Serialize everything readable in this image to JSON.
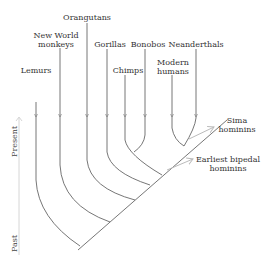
{
  "diagram": {
    "type": "phylogenetic-tree",
    "taxa": [
      {
        "label": "Lemurs"
      },
      {
        "label": "New World monkeys"
      },
      {
        "label": "Orangutans"
      },
      {
        "label": "Gorillas"
      },
      {
        "label": "Chimps"
      },
      {
        "label": "Bonobos"
      },
      {
        "label": "Modern humans"
      },
      {
        "label": "Neanderthals"
      }
    ],
    "labels": {
      "lemurs": "Lemurs",
      "nwm_line1": "New World",
      "nwm_line2": "monkeys",
      "orangutans": "Orangutans",
      "gorillas": "Gorillas",
      "chimps": "Chimps",
      "bonobos": "Bonobos",
      "modern_line1": "Modern",
      "modern_line2": "humans",
      "neanderthals": "Neanderthals"
    },
    "callouts": {
      "sima_line1": "Sima",
      "sima_line2": "hominins",
      "bipedal_line1": "Earliest bipedal",
      "bipedal_line2": "hominins"
    },
    "axis": {
      "top": "Present",
      "bottom": "Past"
    },
    "colors": {
      "line": "#666666",
      "callout_arrow": "#bbbbbb",
      "text": "#333333"
    }
  }
}
